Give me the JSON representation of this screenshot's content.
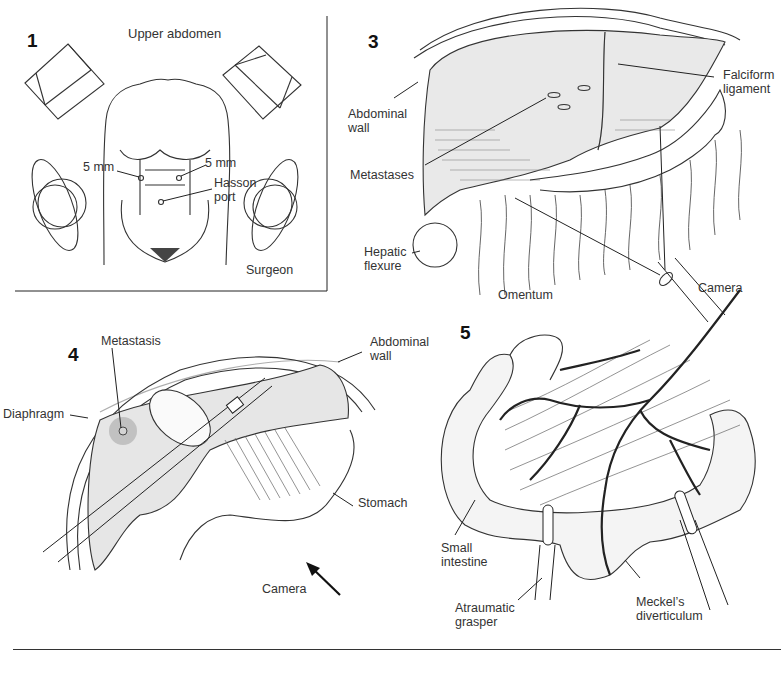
{
  "figure": {
    "panels": [
      {
        "number": "1",
        "title": "Upper abdomen",
        "labels": {
          "left_port": "5 mm",
          "right_port": "5 mm",
          "hasson_line1": "Hasson",
          "hasson_line2": "port",
          "surgeon": "Surgeon"
        }
      },
      {
        "number": "3",
        "labels": {
          "abdominal_wall_line1": "Abdominal",
          "abdominal_wall_line2": "wall",
          "metastases": "Metastases",
          "hepatic_flexure_line1": "Hepatic",
          "hepatic_flexure_line2": "flexure",
          "omentum": "Omentum",
          "falciform_line1": "Falciform",
          "falciform_line2": "ligament",
          "camera": "Camera"
        }
      },
      {
        "number": "4",
        "labels": {
          "metastasis": "Metastasis",
          "diaphragm": "Diaphragm",
          "abdominal_wall_line1": "Abdominal",
          "abdominal_wall_line2": "wall",
          "stomach": "Stomach",
          "camera": "Camera"
        }
      },
      {
        "number": "5",
        "labels": {
          "small_intestine_line1": "Small",
          "small_intestine_line2": "intestine",
          "grasper_line1": "Atraumatic",
          "grasper_line2": "grasper",
          "meckel_line1": "Meckel’s",
          "meckel_line2": "diverticulum"
        }
      }
    ]
  }
}
